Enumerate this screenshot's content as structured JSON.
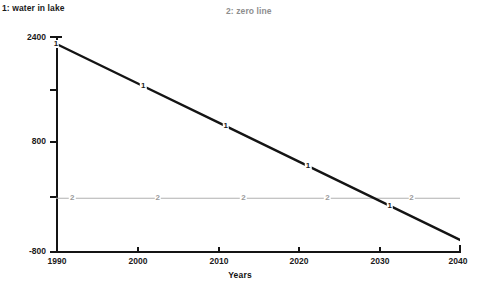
{
  "legend": {
    "series1": "1: water in lake",
    "series2": "2: zero line"
  },
  "axes": {
    "x_title": "Years",
    "x_ticks": [
      "1990",
      "2000",
      "2010",
      "2020",
      "2030",
      "2040"
    ],
    "y_ticks": [
      "2400",
      "800",
      "-800"
    ],
    "y_tick_all": [
      "2400",
      "1600",
      "800",
      "0",
      "-800"
    ]
  },
  "marker_labels": {
    "series1": "1",
    "series2": "2"
  },
  "colors": {
    "series1": "#141414",
    "series2": "#b0b0b0",
    "axis": "#141414",
    "text": "#1a1a1a",
    "legend2": "#8e8e8e",
    "background": "#ffffff"
  },
  "chart_data": {
    "type": "line",
    "title": "",
    "xlabel": "Years",
    "ylabel": "",
    "xlim": [
      1990,
      2040
    ],
    "ylim": [
      -800,
      2400
    ],
    "grid": false,
    "legend_position": "top",
    "x": [
      1990,
      2000,
      2010,
      2020,
      2030,
      2040
    ],
    "series": [
      {
        "name": "1: water in lake",
        "key": "water in lake",
        "marker": "1",
        "values": [
          2300,
          1716,
          1132,
          548,
          -36,
          -620
        ]
      },
      {
        "name": "2: zero line",
        "key": "zero line",
        "marker": "2",
        "values": [
          0,
          0,
          0,
          0,
          0,
          0
        ]
      }
    ],
    "annotations": [
      {
        "text": "1",
        "x": 1990,
        "y": 2300
      },
      {
        "text": "1",
        "x": 2000.8,
        "y": 1670
      },
      {
        "text": "1",
        "x": 2011.0,
        "y": 1075
      },
      {
        "text": "1",
        "x": 2021.2,
        "y": 480
      },
      {
        "text": "1",
        "x": 2031.3,
        "y": -115
      },
      {
        "text": "2",
        "x": 1992.0,
        "y": 0
      },
      {
        "text": "2",
        "x": 2002.6,
        "y": 0
      },
      {
        "text": "2",
        "x": 2013.2,
        "y": 0
      },
      {
        "text": "2",
        "x": 2023.6,
        "y": 0
      },
      {
        "text": "2",
        "x": 2034.0,
        "y": 0
      }
    ]
  }
}
